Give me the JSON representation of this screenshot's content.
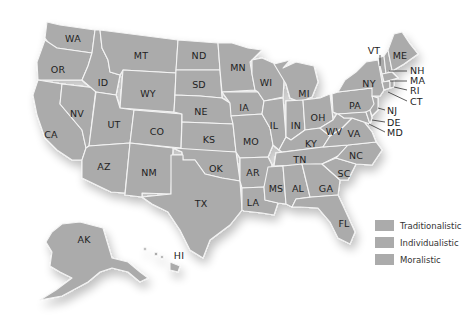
{
  "map": {
    "fill_color": "#ababab",
    "border_color": "#f4f4f4",
    "states": [
      {
        "abbr": "WA",
        "x": 73,
        "y": 38
      },
      {
        "abbr": "OR",
        "x": 58,
        "y": 69
      },
      {
        "abbr": "ID",
        "x": 103,
        "y": 82
      },
      {
        "abbr": "MT",
        "x": 141,
        "y": 55
      },
      {
        "abbr": "WY",
        "x": 148,
        "y": 93
      },
      {
        "abbr": "ND",
        "x": 199,
        "y": 55
      },
      {
        "abbr": "SD",
        "x": 199,
        "y": 84
      },
      {
        "abbr": "MN",
        "x": 238,
        "y": 67
      },
      {
        "abbr": "WI",
        "x": 266,
        "y": 82
      },
      {
        "abbr": "MI",
        "x": 304,
        "y": 93
      },
      {
        "abbr": "NV",
        "x": 77,
        "y": 113
      },
      {
        "abbr": "CA",
        "x": 51,
        "y": 134
      },
      {
        "abbr": "UT",
        "x": 114,
        "y": 124
      },
      {
        "abbr": "CO",
        "x": 157,
        "y": 131
      },
      {
        "abbr": "NE",
        "x": 201,
        "y": 111
      },
      {
        "abbr": "IA",
        "x": 244,
        "y": 107
      },
      {
        "abbr": "IL",
        "x": 274,
        "y": 125
      },
      {
        "abbr": "IN",
        "x": 296,
        "y": 125
      },
      {
        "abbr": "OH",
        "x": 318,
        "y": 117
      },
      {
        "abbr": "PA",
        "x": 355,
        "y": 105
      },
      {
        "abbr": "NY",
        "x": 369,
        "y": 83
      },
      {
        "abbr": "KS",
        "x": 209,
        "y": 139
      },
      {
        "abbr": "MO",
        "x": 251,
        "y": 141
      },
      {
        "abbr": "KY",
        "x": 311,
        "y": 143
      },
      {
        "abbr": "WV",
        "x": 334,
        "y": 131
      },
      {
        "abbr": "VA",
        "x": 354,
        "y": 133
      },
      {
        "abbr": "NC",
        "x": 356,
        "y": 155
      },
      {
        "abbr": "TN",
        "x": 300,
        "y": 159
      },
      {
        "abbr": "SC",
        "x": 344,
        "y": 173
      },
      {
        "abbr": "AZ",
        "x": 104,
        "y": 166
      },
      {
        "abbr": "NM",
        "x": 149,
        "y": 172
      },
      {
        "abbr": "OK",
        "x": 216,
        "y": 168
      },
      {
        "abbr": "AR",
        "x": 253,
        "y": 172
      },
      {
        "abbr": "MS",
        "x": 276,
        "y": 188
      },
      {
        "abbr": "AL",
        "x": 298,
        "y": 188
      },
      {
        "abbr": "GA",
        "x": 326,
        "y": 188
      },
      {
        "abbr": "LA",
        "x": 253,
        "y": 202
      },
      {
        "abbr": "TX",
        "x": 201,
        "y": 203
      },
      {
        "abbr": "FL",
        "x": 344,
        "y": 223
      },
      {
        "abbr": "ME",
        "x": 400,
        "y": 55
      },
      {
        "abbr": "AK",
        "x": 84,
        "y": 239
      },
      {
        "abbr": "HI",
        "x": 179,
        "y": 255
      }
    ],
    "callouts": [
      {
        "abbr": "VT",
        "x": 374,
        "y": 50
      },
      {
        "abbr": "NH",
        "x": 410,
        "y": 70
      },
      {
        "abbr": "MA",
        "x": 410,
        "y": 80
      },
      {
        "abbr": "RI",
        "x": 410,
        "y": 90
      },
      {
        "abbr": "CT",
        "x": 410,
        "y": 101
      },
      {
        "abbr": "NJ",
        "x": 387,
        "y": 110
      },
      {
        "abbr": "DE",
        "x": 387,
        "y": 122
      },
      {
        "abbr": "MD",
        "x": 387,
        "y": 132
      }
    ]
  },
  "legend": {
    "items": [
      {
        "label": "Traditionalistic",
        "color": "#ababab"
      },
      {
        "label": "Individualistic",
        "color": "#ababab"
      },
      {
        "label": "Moralistic",
        "color": "#ababab"
      }
    ]
  }
}
